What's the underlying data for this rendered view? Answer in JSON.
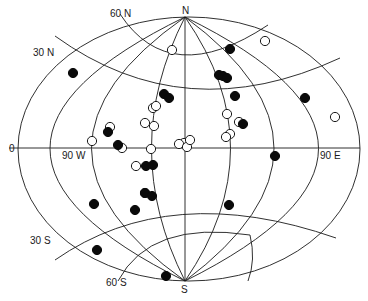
{
  "figure": {
    "type": "world-map-projection",
    "colors": {
      "line": "#1a1a1a",
      "filled_point": "#0a0a0a",
      "open_point": "#ffffff",
      "background": "#ffffff"
    },
    "labels": {
      "north_pole": "N",
      "south_pole": "S",
      "lat_60n": "60 N",
      "lat_30n": "30 N",
      "equator": "0",
      "lat_30s": "30 S",
      "lat_60s": "60 S",
      "lon_90w": "90 W",
      "lon_90e": "90 E"
    },
    "legend": {
      "filled_marker": "filled-circle",
      "open_marker": "open-circle"
    }
  },
  "points": {
    "filled": [
      [
        73,
        73
      ],
      [
        164,
        94
      ],
      [
        169,
        98
      ],
      [
        230,
        49
      ],
      [
        219,
        75
      ],
      [
        223,
        76
      ],
      [
        227,
        78
      ],
      [
        235,
        96
      ],
      [
        305,
        98
      ],
      [
        108,
        132
      ],
      [
        118,
        145
      ],
      [
        153,
        165
      ],
      [
        146,
        166
      ],
      [
        145,
        193
      ],
      [
        152,
        196
      ],
      [
        94,
        204
      ],
      [
        135,
        210
      ],
      [
        97,
        250
      ],
      [
        275,
        156
      ],
      [
        229,
        205
      ],
      [
        166,
        276
      ],
      [
        243,
        124
      ]
    ],
    "open": [
      [
        172,
        50
      ],
      [
        265,
        41
      ],
      [
        153,
        108
      ],
      [
        156,
        106
      ],
      [
        145,
        123
      ],
      [
        154,
        126
      ],
      [
        110,
        127
      ],
      [
        92,
        141
      ],
      [
        122,
        148
      ],
      [
        151,
        149
      ],
      [
        184,
        143
      ],
      [
        179,
        144
      ],
      [
        187,
        147
      ],
      [
        190,
        140
      ],
      [
        227,
        114
      ],
      [
        230,
        134
      ],
      [
        226,
        137
      ],
      [
        239,
        122
      ],
      [
        335,
        117
      ],
      [
        136,
        166
      ],
      [
        145,
        193
      ]
    ]
  }
}
